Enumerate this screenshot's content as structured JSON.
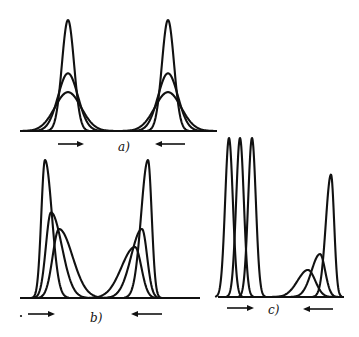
{
  "figure": {
    "stroke_color": "#111111",
    "background": "#ffffff"
  },
  "panels": [
    {
      "id": "a",
      "label": "a)",
      "arrows": [
        {
          "direction": "right"
        },
        {
          "direction": "left"
        }
      ],
      "groups": [
        {
          "name": "left-group",
          "peaks": [
            {
              "relative_height": 1.0,
              "relative_width": 0.35,
              "skew": 0
            },
            {
              "relative_height": 0.52,
              "relative_width": 0.7,
              "skew": 0
            },
            {
              "relative_height": 0.35,
              "relative_width": 1.0,
              "skew": 0
            }
          ]
        },
        {
          "name": "right-group",
          "peaks": [
            {
              "relative_height": 1.0,
              "relative_width": 0.35,
              "skew": 0
            },
            {
              "relative_height": 0.52,
              "relative_width": 0.7,
              "skew": 0
            },
            {
              "relative_height": 0.35,
              "relative_width": 1.0,
              "skew": 0
            }
          ]
        }
      ]
    },
    {
      "id": "b",
      "label": "b)",
      "arrows": [
        {
          "direction": "right"
        },
        {
          "direction": "left"
        }
      ],
      "groups": [
        {
          "name": "left-group",
          "peaks": [
            {
              "relative_height": 1.0,
              "relative_width": 0.4,
              "skew": 0.5
            },
            {
              "relative_height": 0.62,
              "relative_width": 0.75,
              "skew": 0.6
            },
            {
              "relative_height": 0.5,
              "relative_width": 1.0,
              "skew": 0.6
            }
          ]
        },
        {
          "name": "right-group",
          "peaks": [
            {
              "relative_height": 1.0,
              "relative_width": 0.4,
              "skew": -0.5
            },
            {
              "relative_height": 0.5,
              "relative_width": 0.75,
              "skew": -0.6
            },
            {
              "relative_height": 0.37,
              "relative_width": 1.0,
              "skew": -0.6
            }
          ]
        }
      ]
    },
    {
      "id": "c",
      "label": "c)",
      "arrows": [
        {
          "direction": "right"
        },
        {
          "direction": "left"
        }
      ],
      "groups": [
        {
          "name": "narrow-group",
          "peaks": [
            {
              "relative_height": 1.0,
              "relative_width": 0.25,
              "skew": 0
            },
            {
              "relative_height": 1.0,
              "relative_width": 0.25,
              "skew": 0
            },
            {
              "relative_height": 1.0,
              "relative_width": 0.25,
              "skew": 0
            }
          ]
        },
        {
          "name": "skewed-group",
          "peaks": [
            {
              "relative_height": 0.77,
              "relative_width": 0.3,
              "skew": -0.4
            },
            {
              "relative_height": 0.27,
              "relative_width": 0.7,
              "skew": -0.4
            },
            {
              "relative_height": 0.17,
              "relative_width": 1.0,
              "skew": -0.3
            }
          ]
        }
      ]
    }
  ]
}
